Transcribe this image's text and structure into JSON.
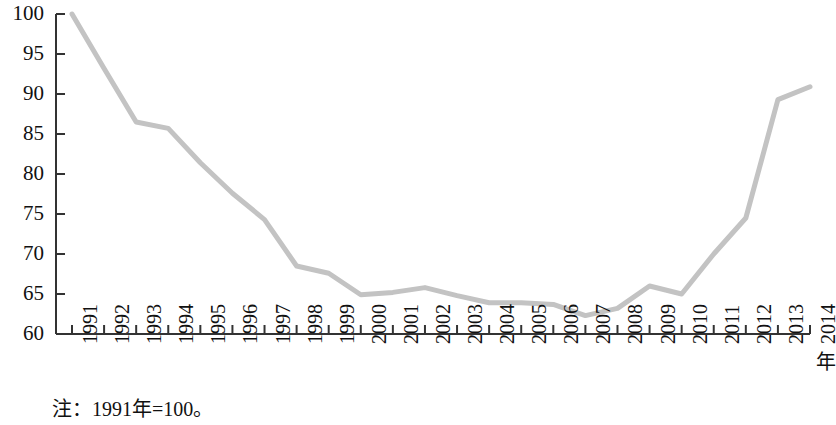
{
  "chart_data": {
    "type": "line",
    "title": "",
    "subtitle": "",
    "xlabel": "年",
    "ylabel": "",
    "note": "注：1991年=100。",
    "grid": false,
    "legend": null,
    "legend_position": "none",
    "line_color": "#c3c3c3",
    "axis_color": "#333333",
    "xlim": [
      1991,
      2014
    ],
    "ylim": [
      60,
      100
    ],
    "ytick_values": [
      60,
      65,
      70,
      75,
      80,
      85,
      90,
      95,
      100
    ],
    "ytick_labels": [
      "60",
      "65",
      "70",
      "75",
      "80",
      "85",
      "90",
      "95",
      "100"
    ],
    "categories": [
      "1991",
      "1992",
      "1993",
      "1994",
      "1995",
      "1996",
      "1997",
      "1998",
      "1999",
      "2000",
      "2001",
      "2002",
      "2003",
      "2004",
      "2005",
      "2006",
      "2007",
      "2008",
      "2009",
      "2010",
      "2011",
      "2012",
      "2013",
      "2014"
    ],
    "x": [
      1991,
      1992,
      1993,
      1994,
      1995,
      1996,
      1997,
      1998,
      1999,
      2000,
      2001,
      2002,
      2003,
      2004,
      2005,
      2006,
      2007,
      2008,
      2009,
      2010,
      2011,
      2012,
      2013,
      2014
    ],
    "values": [
      100.0,
      93.2,
      86.5,
      85.7,
      81.4,
      77.6,
      74.3,
      68.5,
      67.6,
      64.9,
      65.2,
      65.8,
      64.8,
      63.9,
      63.9,
      63.7,
      62.3,
      63.2,
      66.0,
      65.0,
      70.0,
      74.5,
      89.3,
      90.9
    ],
    "series": [
      {
        "name": "指数",
        "values": [
          100.0,
          93.2,
          86.5,
          85.7,
          81.4,
          77.6,
          74.3,
          68.5,
          67.6,
          64.9,
          65.2,
          65.8,
          64.8,
          63.9,
          63.9,
          63.7,
          62.3,
          63.2,
          66.0,
          65.0,
          70.0,
          74.5,
          89.3,
          90.9
        ]
      }
    ]
  }
}
